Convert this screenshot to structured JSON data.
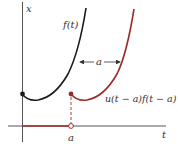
{
  "figure": {
    "axes": {
      "x_label": "t",
      "y_label": "x",
      "tick_label_a": "a"
    },
    "curves": {
      "original_label": "f(t)",
      "shifted_label": "u(t − a)f(t − a)",
      "shift_label": "a"
    },
    "colors": {
      "axis": "#555555",
      "original": "#1a1a1a",
      "shifted": "#9b2a2a"
    }
  }
}
